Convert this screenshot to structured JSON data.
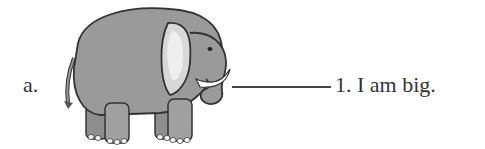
{
  "exercise": {
    "item_label": "a.",
    "image": "elephant-illustration",
    "match_number": "1.",
    "sentence": "I am big.",
    "full_text": "1.  I am big."
  }
}
